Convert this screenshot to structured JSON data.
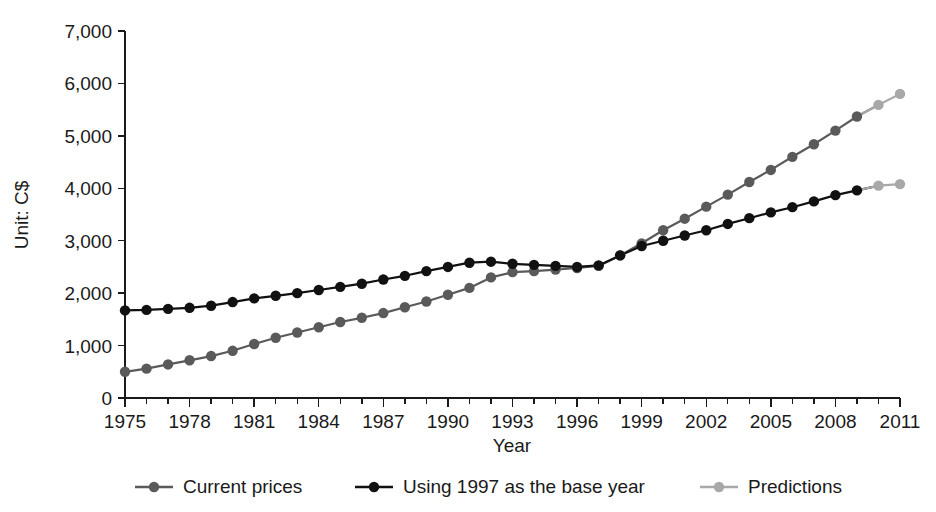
{
  "chart_data": {
    "type": "line",
    "title": "",
    "xlabel": "Year",
    "ylabel": "Unit: C$",
    "xlim": [
      1975,
      2011
    ],
    "ylim": [
      0,
      7000
    ],
    "grid": false,
    "legend_position": "bottom",
    "y_ticks": [
      0,
      1000,
      2000,
      3000,
      4000,
      5000,
      6000,
      7000
    ],
    "y_tick_labels": [
      "0",
      "1,000",
      "2,000",
      "3,000",
      "4,000",
      "5,000",
      "6,000",
      "7,000"
    ],
    "x_ticks": [
      1975,
      1978,
      1981,
      1984,
      1987,
      1990,
      1993,
      1996,
      1999,
      2002,
      2005,
      2008,
      2011
    ],
    "x_tick_labels": [
      "1975",
      "1978",
      "1981",
      "1984",
      "1987",
      "1990",
      "1993",
      "1996",
      "1999",
      "2002",
      "2005",
      "2008",
      "2011"
    ],
    "x_minor_ticks": [
      1976,
      1977,
      1979,
      1980,
      1982,
      1983,
      1985,
      1986,
      1988,
      1989,
      1991,
      1992,
      1994,
      1995,
      1997,
      1998,
      2000,
      2001,
      2003,
      2004,
      2006,
      2007,
      2009,
      2010
    ],
    "x": [
      1975,
      1976,
      1977,
      1978,
      1979,
      1980,
      1981,
      1982,
      1983,
      1984,
      1985,
      1986,
      1987,
      1988,
      1989,
      1990,
      1991,
      1992,
      1993,
      1994,
      1995,
      1996,
      1997,
      1998,
      1999,
      2000,
      2001,
      2002,
      2003,
      2004,
      2005,
      2006,
      2007,
      2008,
      2009,
      2010
    ],
    "series": [
      {
        "name": "Current prices",
        "color": "#5a5a5a",
        "marker": "circle",
        "values": [
          500,
          560,
          640,
          720,
          800,
          900,
          1030,
          1150,
          1250,
          1350,
          1450,
          1530,
          1620,
          1730,
          1840,
          1970,
          2100,
          2300,
          2400,
          2420,
          2450,
          2480,
          2520,
          2720,
          2950,
          3200,
          3420,
          3650,
          3880,
          4120,
          4350,
          4600,
          4840,
          5100,
          5370,
          5590
        ]
      },
      {
        "name": "Using 1997 as the base year",
        "color": "#111111",
        "marker": "circle",
        "values": [
          1670,
          1680,
          1700,
          1720,
          1760,
          1830,
          1900,
          1950,
          2000,
          2060,
          2120,
          2180,
          2260,
          2330,
          2420,
          2500,
          2580,
          2600,
          2560,
          2540,
          2520,
          2500,
          2530,
          2720,
          2900,
          3000,
          3100,
          3200,
          3320,
          3430,
          3540,
          3640,
          3750,
          3870,
          3960,
          4050
        ]
      },
      {
        "name": "Predictions",
        "color": "#a8a8a8",
        "marker": "circle",
        "segments": [
          {
            "from_series": "Current prices",
            "x": [
              2009,
              2010,
              2011
            ],
            "values": [
              5370,
              5590,
              5800
            ]
          },
          {
            "from_series": "Using 1997 as the base year",
            "x": [
              2009,
              2010,
              2011
            ],
            "values": [
              3960,
              4050,
              4080
            ]
          }
        ]
      }
    ],
    "predicted_x": [
      2010,
      2011
    ],
    "annotations": []
  },
  "legend": {
    "items": [
      {
        "label": "Current prices",
        "color": "#5a5a5a"
      },
      {
        "label": "Using 1997 as the base year",
        "color": "#111111"
      },
      {
        "label": "Predictions",
        "color": "#a8a8a8"
      }
    ]
  }
}
